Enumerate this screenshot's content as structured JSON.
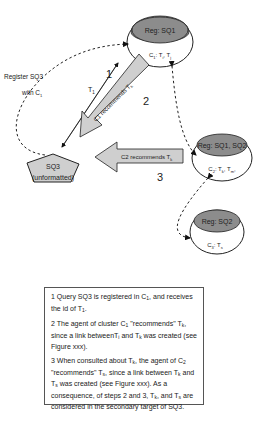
{
  "diagram": {
    "nodes": {
      "sq1": {
        "header": "Reg: SQ1",
        "cluster": "C",
        "cluster_sub": "1",
        "body": ": T",
        "body_items": [
          "1",
          "j"
        ],
        "text": "C1: T1, Tj"
      },
      "sq12": {
        "header": "Reg: SQ1, SQ2",
        "text": "C2: Tk, Tm"
      },
      "sq2": {
        "header": "Reg: SQ2",
        "text": "C3: Ts"
      },
      "sq3": {
        "line1": "SQ3",
        "line2": "(unformatted)"
      }
    },
    "labels": {
      "register_line1": "Register SQ3",
      "register_line2": "with C",
      "register_sub": "1",
      "t1": "T",
      "t1_sub": "1",
      "step1": "1",
      "step2": "2",
      "step3": "3",
      "arrow_c1": "C1 recommends T",
      "arrow_c1_sub": "k",
      "arrow_c2": "C2 recommends T",
      "arrow_c2_sub": "k"
    },
    "colors": {
      "header_fill": "#8c8c8c",
      "arrow_fill": "#cfcfcf",
      "stroke": "#222222"
    }
  },
  "caption": {
    "p1": "1 Query SQ3 is registered in C1, and receives the id of T1.",
    "p2": "2 The agent of cluster C1 \"recommends\" Tk, since a link betweenTi and Tk was created (see Figure xxx).",
    "p3": "3 When consulted about Tk, the agent of C2 \"recommends\" Ts, since a link between Tk and Ts was created (see Figure xxx). As a consequence, of steps 2 and 3, Tk, and Ts are considered in the secondary target of SQ3."
  }
}
